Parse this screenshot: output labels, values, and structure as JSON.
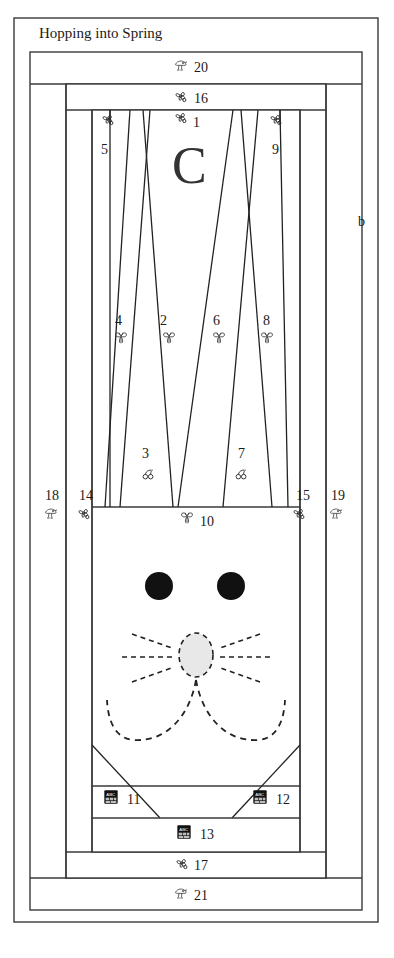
{
  "document": {
    "title": "Hopping into Spring",
    "center_letter": "C",
    "side_marker": "b"
  },
  "icons": {
    "pinwheel": "pinwheel-icon",
    "butterfly": "butterfly-icon",
    "cherries": "cherries-icon",
    "abc_block": "abc-block-icon",
    "bird": "bird-icon"
  },
  "blocks": [
    {
      "num": "1",
      "icon": "pinwheel",
      "x": 172,
      "y": 114,
      "icon_x": 173,
      "icon_y": 110,
      "num_x": 193,
      "num_y": 116
    },
    {
      "num": "2",
      "icon": "butterfly",
      "x": 158,
      "y": 317,
      "icon_x": 161,
      "icon_y": 330,
      "num_x": 160,
      "num_y": 314
    },
    {
      "num": "3",
      "icon": "cherries",
      "x": 141,
      "y": 449,
      "icon_x": 140,
      "icon_y": 466,
      "num_x": 142,
      "num_y": 447
    },
    {
      "num": "4",
      "icon": "butterfly",
      "x": 113,
      "y": 317,
      "icon_x": 113,
      "icon_y": 330,
      "num_x": 115,
      "num_y": 314
    },
    {
      "num": "5",
      "icon": "pinwheel",
      "x": 100,
      "y": 145,
      "icon_x": 100,
      "icon_y": 112,
      "num_x": 101,
      "num_y": 143
    },
    {
      "num": "6",
      "icon": "butterfly",
      "x": 210,
      "y": 317,
      "icon_x": 211,
      "icon_y": 330,
      "num_x": 213,
      "num_y": 314
    },
    {
      "num": "7",
      "icon": "cherries",
      "x": 237,
      "y": 449,
      "icon_x": 233,
      "icon_y": 466,
      "num_x": 238,
      "num_y": 447
    },
    {
      "num": "8",
      "icon": "butterfly",
      "x": 261,
      "y": 317,
      "icon_x": 259,
      "icon_y": 330,
      "num_x": 263,
      "num_y": 314
    },
    {
      "num": "9",
      "icon": "pinwheel",
      "x": 272,
      "y": 145,
      "icon_x": 268,
      "icon_y": 112,
      "num_x": 272,
      "num_y": 143
    },
    {
      "num": "10",
      "icon": "butterfly",
      "x": 201,
      "y": 518,
      "icon_x": 179,
      "icon_y": 510,
      "num_x": 200,
      "num_y": 515
    },
    {
      "num": "11",
      "icon": "abc_block",
      "x": 129,
      "y": 798,
      "icon_x": 103,
      "icon_y": 789,
      "num_x": 127,
      "num_y": 793
    },
    {
      "num": "12",
      "icon": "abc_block",
      "x": 278,
      "y": 798,
      "icon_x": 252,
      "icon_y": 789,
      "num_x": 276,
      "num_y": 793
    },
    {
      "num": "13",
      "icon": "abc_block",
      "x": 203,
      "y": 833,
      "icon_x": 176,
      "icon_y": 824,
      "num_x": 200,
      "num_y": 828
    },
    {
      "num": "14",
      "icon": "pinwheel",
      "x": 86,
      "y": 495,
      "icon_x": 76,
      "icon_y": 506,
      "num_x": 79,
      "num_y": 489
    },
    {
      "num": "15",
      "icon": "pinwheel",
      "x": 303,
      "y": 495,
      "icon_x": 291,
      "icon_y": 506,
      "num_x": 296,
      "num_y": 489
    },
    {
      "num": "16",
      "icon": "pinwheel",
      "x": 197,
      "y": 97,
      "icon_x": 173,
      "icon_y": 89,
      "num_x": 194,
      "num_y": 92
    },
    {
      "num": "17",
      "icon": "pinwheel",
      "x": 197,
      "y": 864,
      "icon_x": 174,
      "icon_y": 856,
      "num_x": 194,
      "num_y": 859
    },
    {
      "num": "18",
      "icon": "bird",
      "x": 52,
      "y": 495,
      "icon_x": 43,
      "icon_y": 506,
      "num_x": 45,
      "num_y": 489
    },
    {
      "num": "19",
      "icon": "bird",
      "x": 337,
      "y": 495,
      "icon_x": 328,
      "icon_y": 506,
      "num_x": 331,
      "num_y": 489
    },
    {
      "num": "20",
      "icon": "bird",
      "x": 197,
      "y": 67,
      "icon_x": 173,
      "icon_y": 58,
      "num_x": 194,
      "num_y": 61
    },
    {
      "num": "21",
      "icon": "bird",
      "x": 197,
      "y": 894,
      "icon_x": 173,
      "icon_y": 886,
      "num_x": 194,
      "num_y": 889
    }
  ],
  "features": {
    "eye_left": "eye-left",
    "eye_right": "eye-right",
    "nose": "nose",
    "whiskers": "whiskers",
    "mouth": "mouth"
  }
}
